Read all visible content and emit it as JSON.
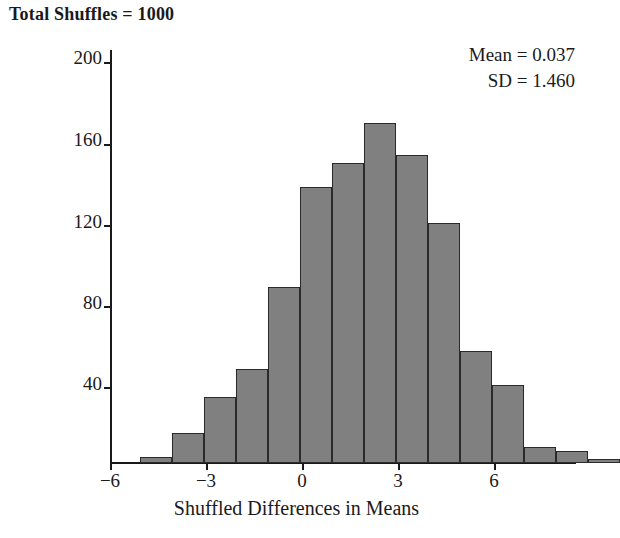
{
  "title": "Total Shuffles = 1000",
  "annotations": {
    "mean_label": "Mean = 0.037",
    "sd_label": "SD = 1.460"
  },
  "axes": {
    "xlabel": "Shuffled Differences in Means",
    "ylabel": "Count",
    "xticks": [
      "−6",
      "−3",
      "0",
      "3",
      "6"
    ],
    "yticks": [
      "200",
      "160",
      "120",
      "80",
      "40"
    ]
  },
  "chart_data": {
    "type": "bar",
    "title": "Total Shuffles = 1000",
    "xlabel": "Shuffled Differences in Means",
    "ylabel": "Count",
    "xlim": [
      -6,
      6.4
    ],
    "ylim": [
      0,
      206
    ],
    "bin_width": 1,
    "grid": false,
    "legend": null,
    "bar_color": "#808080",
    "bar_edge_color": "#2b2b2b",
    "bin_starts": [
      -5,
      -4,
      -3.5,
      -3,
      -2.5,
      -2,
      -1.5,
      -1,
      -0.5,
      0.5,
      1.5,
      2,
      2.5,
      3.5,
      4.5
    ],
    "categories": [
      "-5.0 to -4.0",
      "-4.0 to -3.5",
      "-3.5 to -3.0",
      "-3.0 to -2.0",
      "-2.0 to -1.5",
      "-1.5 to -1.0",
      "-1.0 to -0.5",
      "-0.5 to 0.5",
      "0.5 to 1.0",
      "1.0 to 1.5",
      "1.5 to 2.0",
      "2.0 to 2.5",
      "2.5 to 3.5",
      "3.5 to 4.5",
      "4.5 to 5.5"
    ],
    "values": [
      3,
      15,
      33,
      47,
      88,
      138,
      150,
      170,
      154,
      120,
      56,
      39,
      8,
      6,
      2
    ],
    "bars_px": [
      {
        "left": 30,
        "width": 32,
        "count": 3
      },
      {
        "left": 62,
        "width": 32,
        "count": 15
      },
      {
        "left": 94,
        "width": 32,
        "count": 33
      },
      {
        "left": 126,
        "width": 32,
        "count": 47
      },
      {
        "left": 158,
        "width": 32,
        "count": 88
      },
      {
        "left": 190,
        "width": 32,
        "count": 138
      },
      {
        "left": 222,
        "width": 32,
        "count": 150
      },
      {
        "left": 254,
        "width": 32,
        "count": 170
      },
      {
        "left": 286,
        "width": 32,
        "count": 154
      },
      {
        "left": 318,
        "width": 32,
        "count": 120
      },
      {
        "left": 350,
        "width": 32,
        "count": 56
      },
      {
        "left": 382,
        "width": 32,
        "count": 39
      },
      {
        "left": 414,
        "width": 32,
        "count": 8
      },
      {
        "left": 446,
        "width": 32,
        "count": 6
      },
      {
        "left": 478,
        "width": 32,
        "count": 2
      }
    ],
    "statistics": {
      "total_shuffles": 1000,
      "mean": 0.037,
      "sd": 1.46
    }
  },
  "scale": {
    "y_zero_px": 413,
    "px_per_count": 2.0,
    "x_zero_px": 232,
    "px_per_unit": 32
  }
}
